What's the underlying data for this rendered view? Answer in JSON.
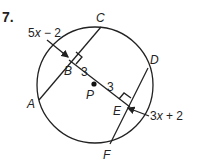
{
  "problem": {
    "number": "7.",
    "center_label": "P",
    "points": {
      "A": "A",
      "B": "B",
      "C": "C",
      "D": "D",
      "E": "E",
      "F": "F"
    },
    "segments": {
      "PB": "3",
      "PE": "3"
    },
    "expressions": {
      "chord_AC_label": {
        "coef": "5",
        "var": "x",
        "rest": " − 2"
      },
      "chord_DF_label": {
        "coef": "3",
        "var": "x",
        "rest": " + 2"
      }
    }
  }
}
